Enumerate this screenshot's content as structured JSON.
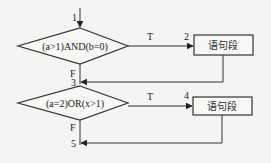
{
  "diagram": {
    "type": "flowchart",
    "entry_label": "1",
    "decisions": [
      {
        "condition": "(a>1)AND(b=0)",
        "true_label": "T",
        "false_label": "F",
        "true_node_label": "2",
        "merge_label": "3",
        "true_box_text": "语句段"
      },
      {
        "condition": "(a=2)OR(x>1)",
        "true_label": "T",
        "false_label": "F",
        "true_node_label": "4",
        "merge_label": "5",
        "true_box_text": "语句段"
      }
    ]
  }
}
